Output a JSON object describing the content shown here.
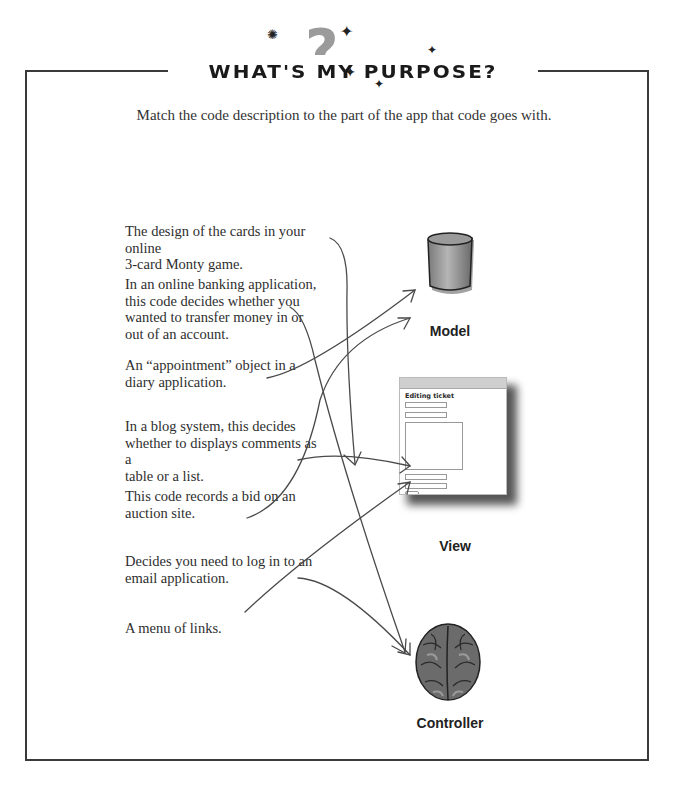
{
  "header": {
    "title": "What's my purpose?",
    "decoration": [
      "question-mark",
      "sparkle-stars"
    ]
  },
  "instruction": "Match the code description to the part of the app that code goes with.",
  "descriptions": [
    {
      "lines": [
        "The design of the cards in your online",
        "3-card Monty game."
      ],
      "matches": "View"
    },
    {
      "lines": [
        "In an online banking application,",
        "this code decides whether you",
        "wanted to transfer money in or",
        "out of an account."
      ],
      "matches": "Controller"
    },
    {
      "lines": [
        "An “appointment” object in a",
        "diary application."
      ],
      "matches": "Model"
    },
    {
      "lines": [
        "In a blog system, this decides",
        "whether to displays comments as a",
        "table or a list."
      ],
      "matches": "View"
    },
    {
      "lines": [
        "This code records a bid on an",
        "auction site."
      ],
      "matches": "Model"
    },
    {
      "lines": [
        "Decides you need to log in to an",
        "email application."
      ],
      "matches": "Controller"
    },
    {
      "lines": [
        "A menu of links."
      ],
      "matches": "View"
    }
  ],
  "targets": {
    "model": {
      "label": "Model",
      "icon": "database-cylinder-icon"
    },
    "view": {
      "label": "View",
      "icon": "browser-window-icon",
      "mock_heading": "Editing ticket"
    },
    "controller": {
      "label": "Controller",
      "icon": "brain-icon"
    }
  },
  "colors": {
    "border": "#3a3a3a",
    "text": "#2e2e2e",
    "arrow": "#4a4a4a"
  }
}
